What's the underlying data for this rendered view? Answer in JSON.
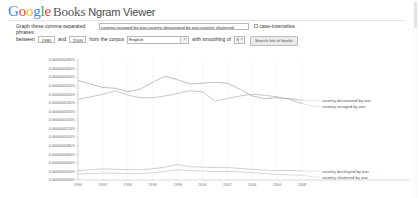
{
  "header": {
    "logo_google": "Google",
    "logo_books": "Books",
    "logo_ngram": "Ngram Viewer"
  },
  "form": {
    "phrases_label_line1": "Graph these comma-separated",
    "phrases_label_line2": "phrases:",
    "phrases_value": "country ravaged by war,country devastated by war,country shattered",
    "between_label": "between",
    "year_start": "1980",
    "and_label": "and",
    "year_end": "2008",
    "corpus_label": "from the corpus",
    "corpus_value": "English",
    "smoothing_label": "with smoothing of",
    "smoothing_value": "3",
    "case_insensitive_label": "case-insensitive",
    "case_insensitive_checked": false,
    "search_button": "Search lots of books",
    "dropdown_arrow": "▾"
  },
  "chart_data": {
    "type": "line",
    "title": "",
    "xlabel": "",
    "ylabel": "",
    "xlim": [
      1990,
      2008
    ],
    "ylim": [
      0.0,
      2.8e-08
    ],
    "grid": true,
    "legend_position": "right",
    "xticks": [
      "1990",
      "1992",
      "1994",
      "1996",
      "1998",
      "2000",
      "2002",
      "2004",
      "2006",
      "2008"
    ],
    "yticks": [
      "0.0000000280%",
      "0.0000000260%",
      "0.0000000240%",
      "0.0000000220%",
      "0.0000000200%",
      "0.0000000180%",
      "0.0000000160%",
      "0.0000000140%",
      "0.0000000120%",
      "0.0000000100%",
      "0.0000000080%",
      "0.0000000060%",
      "0.0000000040%",
      "0.0000000020%",
      "0.0000000000%"
    ],
    "x": [
      1990,
      1991,
      1992,
      1993,
      1994,
      1995,
      1996,
      1997,
      1998,
      1999,
      2000,
      2001,
      2002,
      2003,
      2004,
      2005,
      2006,
      2007,
      2008
    ],
    "series": [
      {
        "name": "country devastated by war",
        "color": "#8a8a8a",
        "values": [
          2.32e-08,
          2.24e-08,
          2.16e-08,
          2.14e-08,
          2.06e-08,
          2.12e-08,
          2.28e-08,
          2.42e-08,
          2.34e-08,
          2.24e-08,
          2.26e-08,
          2.28e-08,
          2.26e-08,
          2.12e-08,
          1.96e-08,
          1.9e-08,
          1.92e-08,
          1.9e-08,
          1.86e-08
        ]
      },
      {
        "name": "country ravaged by war",
        "color": "#9a9a9a",
        "values": [
          1.88e-08,
          1.94e-08,
          2e-08,
          2.08e-08,
          1.98e-08,
          1.92e-08,
          1.92e-08,
          1.96e-08,
          2.02e-08,
          2.08e-08,
          2.06e-08,
          1.84e-08,
          1.9e-08,
          1.96e-08,
          2e-08,
          1.98e-08,
          1.94e-08,
          1.88e-08,
          1.78e-08
        ]
      },
      {
        "name": "country destroyed by war",
        "color": "#a8a8a8",
        "values": [
          2.2e-09,
          2.4e-09,
          2.6e-09,
          2.5e-09,
          2.4e-09,
          2.4e-09,
          2.6e-09,
          3e-09,
          3.6e-09,
          3.1e-09,
          3e-09,
          2.9e-09,
          2.9e-09,
          2.7e-09,
          2.5e-09,
          2.3e-09,
          2.2e-09,
          2.2e-09,
          2.1e-09
        ]
      },
      {
        "name": "country shattered by war",
        "color": "#b2b2b2",
        "values": [
          1.4e-09,
          1.5e-09,
          1.6e-09,
          1.6e-09,
          1.5e-09,
          1.5e-09,
          1.7e-09,
          2e-09,
          2.4e-09,
          2.2e-09,
          2.1e-09,
          2e-09,
          2e-09,
          1.9e-09,
          1.7e-09,
          1.5e-09,
          1.3e-09,
          1.2e-09,
          1.1e-09
        ]
      }
    ]
  }
}
